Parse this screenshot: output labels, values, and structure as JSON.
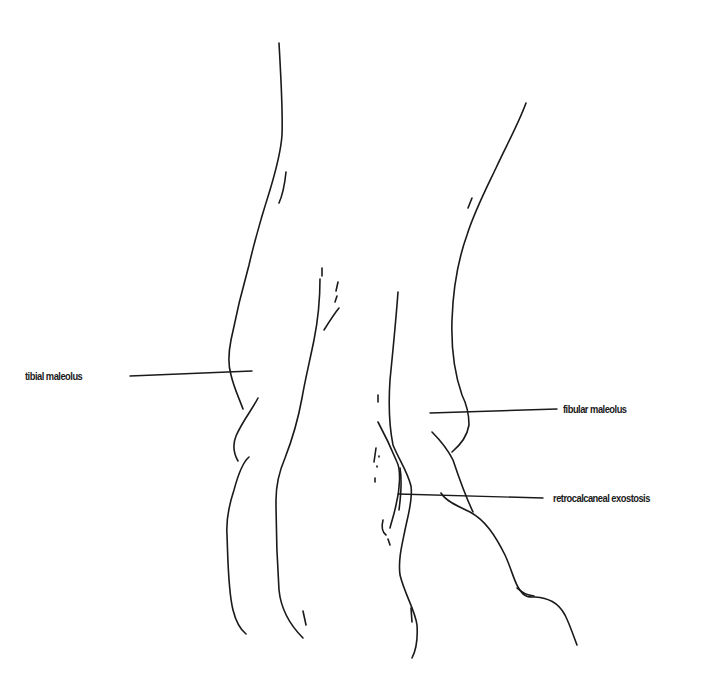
{
  "diagram": {
    "stroke_color": "#1a1a1a",
    "background_color": "#ffffff",
    "labels": [
      {
        "id": "tibial",
        "text": "tibial maleolus",
        "side": "left"
      },
      {
        "id": "fibular",
        "text": "fibular maleolus",
        "side": "right"
      },
      {
        "id": "retrocalcaneal",
        "text": "retrocalcaneal exostosis",
        "side": "right"
      }
    ]
  }
}
